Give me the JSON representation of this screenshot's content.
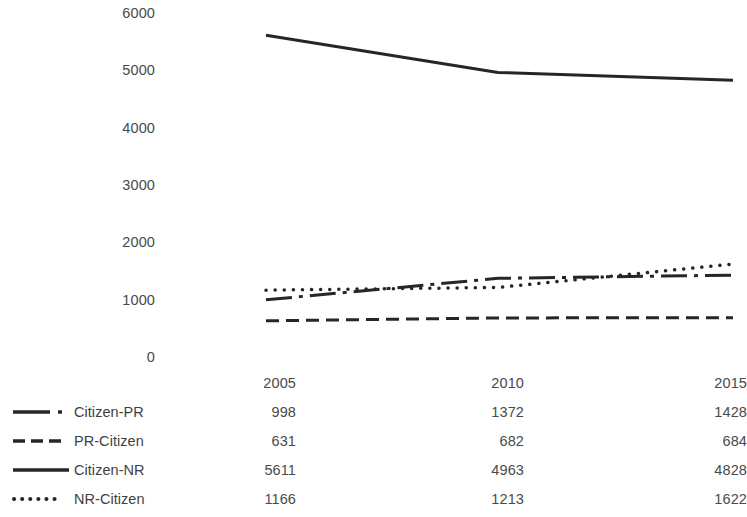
{
  "chart_data": {
    "type": "line",
    "title": "",
    "subtitle": "",
    "xlabel": "",
    "ylabel": "",
    "categories": [
      "2005",
      "2010",
      "2015"
    ],
    "x": [
      2005,
      2010,
      2015
    ],
    "ylim": [
      0,
      6000
    ],
    "y_ticks": [
      "0",
      "1000",
      "2000",
      "3000",
      "4000",
      "5000",
      "6000"
    ],
    "y_tick_values": [
      0,
      1000,
      2000,
      3000,
      4000,
      5000,
      6000
    ],
    "grid": false,
    "legend_position": "data-table-left",
    "has_data_table": true,
    "series": [
      {
        "name": "Citizen-PR",
        "values": [
          998,
          1372,
          1428
        ],
        "line_style": "dash-dot",
        "color": "#262626",
        "width": 3
      },
      {
        "name": "PR-Citizen",
        "values": [
          631,
          682,
          684
        ],
        "line_style": "dashed",
        "color": "#262626",
        "width": 3
      },
      {
        "name": "Citizen-NR",
        "values": [
          5611,
          4963,
          4828
        ],
        "line_style": "solid",
        "color": "#262626",
        "width": 3
      },
      {
        "name": "NR-Citizen",
        "values": [
          1166,
          1213,
          1622
        ],
        "line_style": "dotted",
        "color": "#262626",
        "width": 3.5
      }
    ]
  },
  "axis": {
    "y_labels": [
      "6000",
      "5000",
      "4000",
      "3000",
      "2000",
      "1000",
      "0"
    ]
  },
  "table": {
    "column_headers": [
      "2005",
      "2010",
      "2015"
    ],
    "rows": [
      {
        "label": "Citizen-PR",
        "marker": "dash-dot-line-marker",
        "values": [
          "998",
          "1372",
          "1428"
        ]
      },
      {
        "label": "PR-Citizen",
        "marker": "dashed-line-marker",
        "values": [
          "631",
          "682",
          "684"
        ]
      },
      {
        "label": "Citizen-NR",
        "marker": "solid-line-marker",
        "values": [
          "5611",
          "4963",
          "4828"
        ]
      },
      {
        "label": "NR-Citizen",
        "marker": "dotted-line-marker",
        "values": [
          "1166",
          "1213",
          "1622"
        ]
      }
    ]
  },
  "colors": {
    "series": "#262626",
    "text": "#4a4a4a",
    "background": "#ffffff"
  }
}
